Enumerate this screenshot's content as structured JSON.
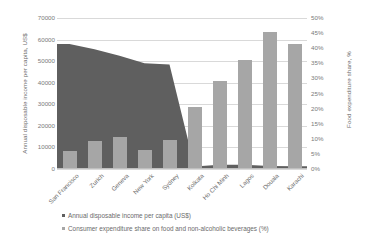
{
  "chart_data": {
    "type": "bar",
    "title": "",
    "subtitle": "",
    "categories": [
      "San Francisco",
      "Zurich",
      "Geneva",
      "New York",
      "Sydney",
      "Kolkata",
      "Ho Chi Minh",
      "Lagos",
      "Douala",
      "Karachi"
    ],
    "series": [
      {
        "name": "Annual disposable income per capita (US$)",
        "type": "area",
        "axis": "left",
        "color": "#5f5f5f",
        "values": [
          58000,
          55500,
          52500,
          49000,
          48500,
          1200,
          2000,
          2000,
          1400,
          1300
        ]
      },
      {
        "name": "Consumer expenditure share on food and non-alcoholic beverages (%)",
        "type": "bar",
        "axis": "right",
        "color": "#a6a6a6",
        "values": [
          5.9,
          9.3,
          10.5,
          6.2,
          9.5,
          20.7,
          29.0,
          36.0,
          45.5,
          41.3
        ]
      }
    ],
    "xlabel": "",
    "ylabel": "Annual disposable income per capita, US$",
    "y2label": "Food expenditure share, %",
    "ylim": [
      0,
      70000
    ],
    "y2lim": [
      0,
      50
    ],
    "yticks": [
      "0",
      "10000",
      "20000",
      "30000",
      "40000",
      "50000",
      "60000",
      "70000"
    ],
    "y2ticks": [
      "0%",
      "5%",
      "10%",
      "15%",
      "20%",
      "25%",
      "30%",
      "35%",
      "40%",
      "45%",
      "50%"
    ],
    "grid": true,
    "legend_position": "bottom-left"
  },
  "axes": {
    "left_title": "Annual disposable income per capita,  US$",
    "right_title": "Food expenditure share, %"
  },
  "legend": {
    "items": [
      {
        "label": "Annual disposable income per capita (US$)"
      },
      {
        "label": "Consumer expenditure share on food and non-alcoholic beverages (%)"
      }
    ]
  }
}
